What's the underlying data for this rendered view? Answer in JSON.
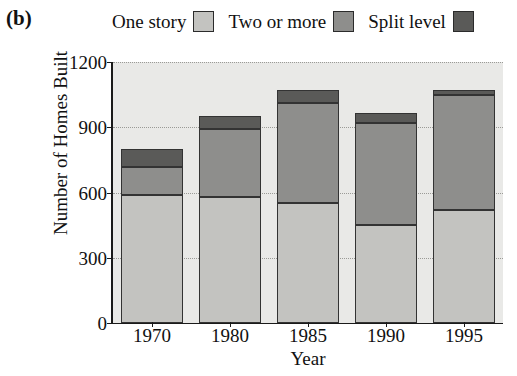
{
  "panel": {
    "label": "(b)"
  },
  "legend": {
    "position": "top",
    "entries": [
      {
        "label": "One story",
        "color": "#c3c3c0",
        "name": "one-story"
      },
      {
        "label": "Two or more",
        "color": "#8e8e8c",
        "name": "two-or-more"
      },
      {
        "label": "Split level",
        "color": "#5a5a58",
        "name": "split-level"
      }
    ]
  },
  "axes": {
    "ylabel": "Number of Homes Built",
    "xlabel": "Year",
    "yticks": [
      "0",
      "300",
      "600",
      "900",
      "1200"
    ],
    "xticks": [
      "1970",
      "1980",
      "1985",
      "1990",
      "1995"
    ]
  },
  "chart_data": {
    "type": "bar",
    "subtype": "stacked-bar",
    "title": "(b)",
    "xlabel": "Year",
    "ylabel": "Number of Homes Built",
    "categories": [
      "1970",
      "1980",
      "1985",
      "1990",
      "1995"
    ],
    "series": [
      {
        "name": "One story",
        "color": "#c3c3c0",
        "values": [
          590,
          580,
          550,
          450,
          520
        ]
      },
      {
        "name": "Two or more",
        "color": "#8e8e8c",
        "values": [
          125,
          310,
          460,
          470,
          530
        ]
      },
      {
        "name": "Split level",
        "color": "#5a5a58",
        "values": [
          85,
          60,
          60,
          45,
          20
        ]
      }
    ],
    "totals": [
      800,
      950,
      1070,
      965,
      1070
    ],
    "ylim": [
      0,
      1200
    ],
    "ytick_step": 300,
    "grid": "horizontal-dotted",
    "legend_position": "top",
    "plot_background": "#e9e9e7"
  }
}
